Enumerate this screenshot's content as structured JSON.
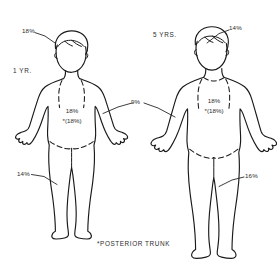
{
  "diagram": {
    "caption": "*POSTERIOR TRUNK",
    "ink_color": "#1a1a1a",
    "background_color": "#ffffff"
  },
  "figures": [
    {
      "id": "figure-1yr",
      "age_label": "1 YR.",
      "labels": {
        "head": "18%",
        "trunk_anterior": "18%",
        "trunk_posterior": "*(18%)",
        "leg": "14%"
      }
    },
    {
      "id": "figure-5yrs",
      "age_label": "5 YRS.",
      "labels": {
        "head": "14%",
        "trunk_anterior": "18%",
        "trunk_posterior": "*(18%)",
        "leg": "16%"
      }
    }
  ],
  "shared_labels": {
    "arm": "9%"
  },
  "icons": {
    "child_body": "child-body-outline-icon"
  }
}
